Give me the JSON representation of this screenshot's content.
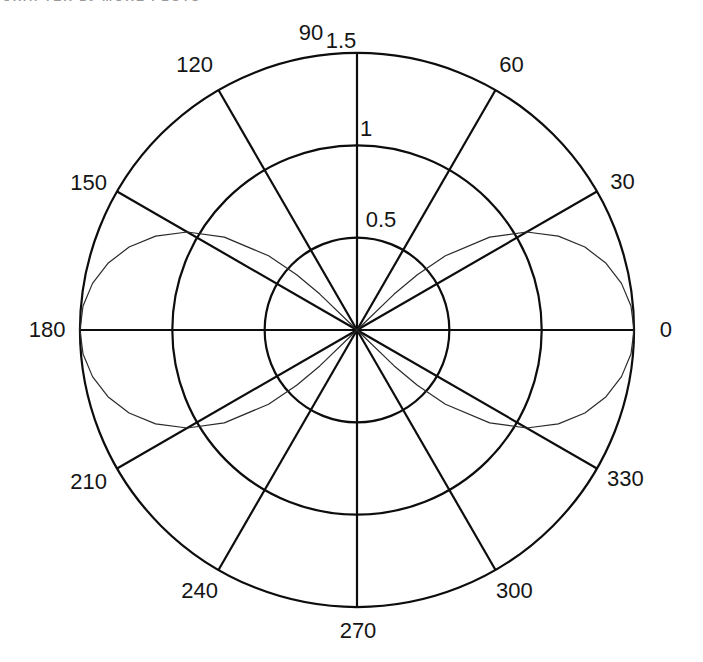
{
  "header": {
    "fragment_text": "CHAPTER 10   MORE PLOTS"
  },
  "chart_data": {
    "type": "line",
    "subtype": "polar",
    "title": "",
    "xlabel": "",
    "ylabel": "",
    "grid": true,
    "rmax": 1.5,
    "angle_ticks_deg": [
      0,
      30,
      60,
      90,
      120,
      150,
      180,
      210,
      240,
      270,
      300,
      330
    ],
    "angle_tick_labels": [
      "0",
      "30",
      "60",
      "90",
      "120",
      "150",
      "180",
      "210",
      "240",
      "270",
      "300",
      "330"
    ],
    "radius_ticks": [
      0.5,
      1,
      1.5
    ],
    "radius_tick_labels": [
      "0.5",
      "1",
      "1.5"
    ],
    "curve": {
      "name": "two-lobe-lemniscate",
      "equation": "r = 1.5*sqrt(cos(2*theta)), plotted where cos(2*theta) >= 0",
      "lobes": [
        [
          [
            -45,
            0
          ],
          [
            -44,
            0.28
          ],
          [
            -42.5,
            0.443
          ],
          [
            -40,
            0.625
          ],
          [
            -35,
            0.877
          ],
          [
            -30,
            1.061
          ],
          [
            -25,
            1.203
          ],
          [
            -20,
            1.313
          ],
          [
            -15,
            1.396
          ],
          [
            -10,
            1.454
          ],
          [
            -5,
            1.489
          ],
          [
            0,
            1.5
          ],
          [
            5,
            1.489
          ],
          [
            10,
            1.454
          ],
          [
            15,
            1.396
          ],
          [
            20,
            1.313
          ],
          [
            25,
            1.203
          ],
          [
            30,
            1.061
          ],
          [
            35,
            0.877
          ],
          [
            40,
            0.625
          ],
          [
            42.5,
            0.443
          ],
          [
            44,
            0.28
          ],
          [
            45,
            0
          ]
        ],
        [
          [
            135,
            0
          ],
          [
            136,
            0.28
          ],
          [
            137.5,
            0.443
          ],
          [
            140,
            0.625
          ],
          [
            145,
            0.877
          ],
          [
            150,
            1.061
          ],
          [
            155,
            1.203
          ],
          [
            160,
            1.313
          ],
          [
            165,
            1.396
          ],
          [
            170,
            1.454
          ],
          [
            175,
            1.489
          ],
          [
            180,
            1.5
          ],
          [
            185,
            1.489
          ],
          [
            190,
            1.454
          ],
          [
            195,
            1.396
          ],
          [
            200,
            1.313
          ],
          [
            205,
            1.203
          ],
          [
            210,
            1.061
          ],
          [
            215,
            0.877
          ],
          [
            220,
            0.625
          ],
          [
            222.5,
            0.443
          ],
          [
            224,
            0.28
          ],
          [
            225,
            0
          ]
        ]
      ]
    },
    "colors": {
      "grid": "#0d0d0d",
      "curve": "#2a2a2a",
      "label": "#151515",
      "background": "#ffffff"
    }
  }
}
